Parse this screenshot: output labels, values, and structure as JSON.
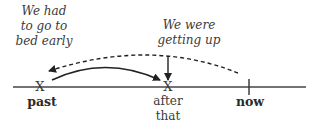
{
  "diagram": {
    "type": "timeline",
    "events": {
      "past_event_note": [
        "We had",
        "to go to",
        "bed early"
      ],
      "progressive_note": [
        "We were",
        "getting up"
      ]
    },
    "points": {
      "past": {
        "marker": "X",
        "label": "past"
      },
      "after": {
        "marker": "X",
        "label_lines": [
          "after",
          "that"
        ]
      },
      "now": {
        "marker": "tick",
        "label": "now"
      }
    },
    "arrows": [
      {
        "style": "solid",
        "from": "past",
        "to": "after",
        "meaning": "sequence"
      },
      {
        "style": "dashed",
        "from": "now",
        "to": "past",
        "meaning": "looking back"
      },
      {
        "style": "solid",
        "direction": "down",
        "target": "after",
        "meaning": "progressive action point"
      }
    ],
    "colors": {
      "line": "#333333",
      "text": "#2b2b2b"
    }
  }
}
